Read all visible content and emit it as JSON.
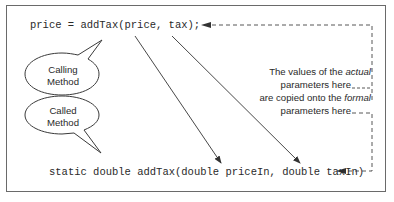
{
  "diagram": {
    "calling_code": "price = addTax(price, tax);",
    "called_code": "static double addTax(double priceIn, double taxIn)",
    "bubbles": [
      {
        "id": "calling",
        "line1": "Calling",
        "line2": "Method"
      },
      {
        "id": "called",
        "line1": "Called",
        "line2": "Method"
      }
    ],
    "note": {
      "line1_pre": "The values of the ",
      "line1_em": "actual",
      "line2": "parameters here",
      "line3_pre": "are copied onto the ",
      "line3_em": "formal",
      "line4": "parameters here"
    },
    "colors": {
      "border": "#6a6a6a",
      "text": "#2a2a2a",
      "arrow": "#333333",
      "background": "#ffffff"
    }
  }
}
